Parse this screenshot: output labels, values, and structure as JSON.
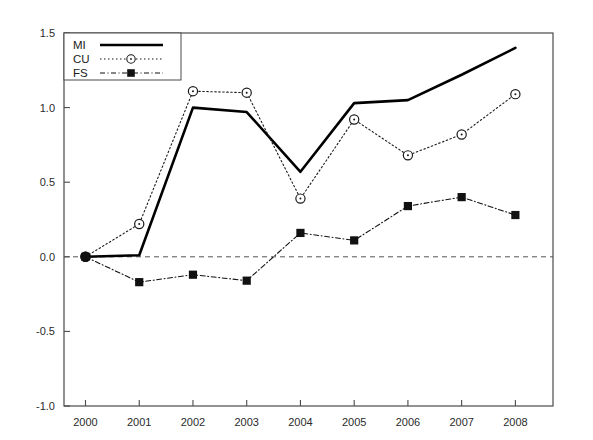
{
  "chart_data": {
    "type": "line",
    "title": "",
    "subtitle": "",
    "xlabel": "",
    "ylabel": "",
    "categories": [
      "2000",
      "2001",
      "2002",
      "2003",
      "2004",
      "2005",
      "2006",
      "2007",
      "2008"
    ],
    "x": [
      2000,
      2001,
      2002,
      2003,
      2004,
      2005,
      2006,
      2007,
      2008
    ],
    "xlim": [
      1999.6,
      2008.7
    ],
    "ylim": [
      -1.0,
      1.5
    ],
    "yticks": [
      -1.0,
      -0.5,
      0.0,
      0.5,
      1.0,
      1.5
    ],
    "ytick_labels": [
      "-1.0",
      "-0.5",
      "0.0",
      "0.5",
      "1.0",
      "1.5"
    ],
    "xticks": [
      2000,
      2001,
      2002,
      2003,
      2004,
      2005,
      2006,
      2007,
      2008
    ],
    "xtick_labels": [
      "2000",
      "2001",
      "2002",
      "2003",
      "2004",
      "2005",
      "2006",
      "2007",
      "2008"
    ],
    "grid": false,
    "zero_reference_line": {
      "value": 0.0,
      "style": "dashed",
      "color": "#555555"
    },
    "legend_position": "top-left",
    "series": [
      {
        "name": "MI",
        "values": [
          0.0,
          0.01,
          1.0,
          0.97,
          0.57,
          1.03,
          1.05,
          1.22,
          1.4
        ],
        "line_style": "solid",
        "marker": "none",
        "color": "#000000",
        "line_width": 2.6
      },
      {
        "name": "CU",
        "values": [
          0.0,
          0.22,
          1.11,
          1.1,
          0.39,
          0.92,
          0.68,
          0.82,
          1.09
        ],
        "line_style": "dotted",
        "marker": "open-circle",
        "color": "#1a1a1a",
        "line_width": 1.1
      },
      {
        "name": "FS",
        "values": [
          0.0,
          -0.17,
          -0.12,
          -0.16,
          0.16,
          0.11,
          0.34,
          0.4,
          0.28
        ],
        "line_style": "dashdot",
        "marker": "filled-square",
        "color": "#111111",
        "line_width": 1.1
      }
    ]
  },
  "legend": {
    "entries": [
      {
        "label": "MI"
      },
      {
        "label": "CU"
      },
      {
        "label": "FS"
      }
    ]
  }
}
